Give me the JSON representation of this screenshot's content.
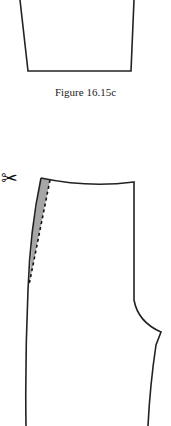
{
  "figure": {
    "caption": "Figure 16.15c",
    "scissors_glyph": "✂",
    "colors": {
      "stroke": "#222222",
      "shade": "#a6a6a6",
      "background": "#ffffff"
    }
  }
}
